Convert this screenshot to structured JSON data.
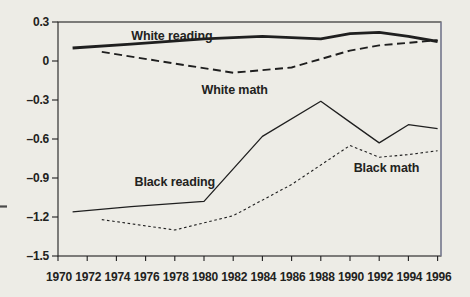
{
  "figure": {
    "background_color": "#edece6",
    "ink_color": "#1f1f1f",
    "scan_right_border_color": "#9aa0bf",
    "margin_artifact": "left-edge-dash"
  },
  "chart_data": {
    "type": "line",
    "title": "",
    "xlabel": "",
    "ylabel": "",
    "xlim": [
      1970,
      1996.3
    ],
    "ylim": [
      -1.5,
      0.3
    ],
    "grid": false,
    "legend_position": "inline-labels",
    "x_tick_values": [
      1970,
      1972,
      1974,
      1976,
      1978,
      1980,
      1982,
      1984,
      1986,
      1988,
      1990,
      1992,
      1994,
      1996
    ],
    "x_tick_labels": [
      "1970",
      "1972",
      "1974",
      "1976",
      "1978",
      "1980",
      "1982",
      "1984",
      "1986",
      "1988",
      "1990",
      "1992",
      "1994",
      "1996"
    ],
    "y_tick_values": [
      0.3,
      0,
      -0.3,
      -0.6,
      -0.9,
      -1.2,
      -1.5
    ],
    "y_tick_labels": [
      "0.3",
      "0",
      "–0.3",
      "–0.6",
      "–0.9",
      "–1.2",
      "–1.5"
    ],
    "series": [
      {
        "name": "White reading",
        "line_style": "solid",
        "stroke_width": 2.8,
        "x": [
          1971,
          1975,
          1980,
          1984,
          1988,
          1990,
          1992,
          1994,
          1996
        ],
        "values": [
          0.1,
          0.13,
          0.17,
          0.19,
          0.17,
          0.21,
          0.22,
          0.19,
          0.15
        ],
        "label": {
          "text": "White reading",
          "x": 1977.8,
          "y": 0.195
        }
      },
      {
        "name": "White math",
        "line_style": "dashed",
        "stroke_width": 1.9,
        "x": [
          1973,
          1978,
          1982,
          1986,
          1990,
          1992,
          1994,
          1996
        ],
        "values": [
          0.07,
          -0.02,
          -0.09,
          -0.05,
          0.08,
          0.12,
          0.14,
          0.16
        ],
        "label": {
          "text": "White math",
          "x": 1982.1,
          "y": -0.22
        }
      },
      {
        "name": "Black reading",
        "line_style": "solid",
        "stroke_width": 1.3,
        "x": [
          1971,
          1975,
          1980,
          1984,
          1988,
          1990,
          1992,
          1994,
          1996
        ],
        "values": [
          -1.16,
          -1.12,
          -1.08,
          -0.58,
          -0.31,
          -0.47,
          -0.63,
          -0.49,
          -0.52
        ],
        "label": {
          "text": "Black reading",
          "x": 1978.0,
          "y": -0.93
        }
      },
      {
        "name": "Black math",
        "line_style": "dotted",
        "stroke_width": 1.1,
        "x": [
          1973,
          1978,
          1982,
          1986,
          1990,
          1992,
          1994,
          1996
        ],
        "values": [
          -1.22,
          -1.3,
          -1.19,
          -0.95,
          -0.65,
          -0.74,
          -0.72,
          -0.69
        ],
        "label": {
          "text": "Black math",
          "x": 1992.5,
          "y": -0.82
        }
      }
    ]
  }
}
